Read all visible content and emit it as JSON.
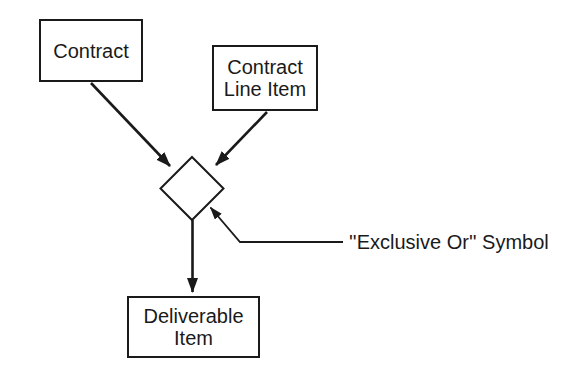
{
  "diagram": {
    "background_color": "#ffffff",
    "ink_color": "#1a1a1a",
    "boxes": [
      {
        "name": "contract",
        "lines": [
          "Contract"
        ]
      },
      {
        "name": "contract-line-item",
        "lines": [
          "Contract",
          "Line Item"
        ]
      },
      {
        "name": "deliverable-item",
        "lines": [
          "Deliverable",
          "Item"
        ]
      }
    ],
    "symbol": {
      "shape": "diamond",
      "meaning": "exclusive-or"
    },
    "arrows": [
      {
        "from": "contract",
        "to": "exclusive-or-symbol"
      },
      {
        "from": "contract-line-item",
        "to": "exclusive-or-symbol"
      },
      {
        "from": "exclusive-or-symbol",
        "to": "deliverable-item"
      }
    ],
    "annotation": {
      "label": "''Exclusive Or'' Symbol"
    }
  }
}
